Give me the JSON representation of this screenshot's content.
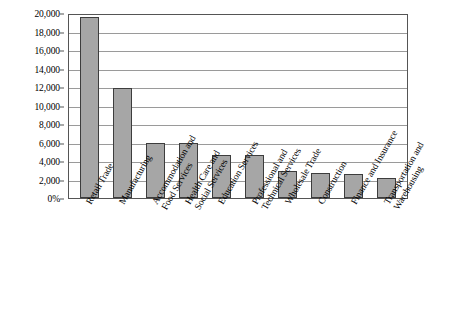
{
  "chart_data": {
    "type": "bar",
    "title": "",
    "xlabel": "",
    "ylabel": "",
    "ylim": [
      0,
      20000
    ],
    "grid": true,
    "legend": "none",
    "categories": [
      "Retail Trade",
      "Manufacturing",
      "Accommodation and Food Services",
      "Health Care and Social Services",
      "Education Services",
      "Professional and Technical Services",
      "Wholesale Trade",
      "Construction",
      "Finance and Insurance",
      "Transportation and Warehousing"
    ],
    "category_lines": [
      [
        "Retail Trade"
      ],
      [
        "Manufacturing"
      ],
      [
        "Accommodation and",
        "Food Services"
      ],
      [
        "Health Care and",
        "Social Services"
      ],
      [
        "Education Services"
      ],
      [
        "Professional and",
        "Technical Services"
      ],
      [
        "Wholesale Trade"
      ],
      [
        "Construction"
      ],
      [
        "Finance and Insurance"
      ],
      [
        "Transportation and",
        "Warehousing"
      ]
    ],
    "values": [
      19600,
      11900,
      6000,
      6000,
      4700,
      4600,
      2900,
      2700,
      2600,
      2200
    ],
    "ticks": [
      {
        "value": 20000,
        "label": "20,000"
      },
      {
        "value": 18000,
        "label": "18,000"
      },
      {
        "value": 16000,
        "label": "16,000"
      },
      {
        "value": 14000,
        "label": "14,000"
      },
      {
        "value": 12000,
        "label": "12,000"
      },
      {
        "value": 10000,
        "label": "10,000"
      },
      {
        "value": 8000,
        "label": "8,000"
      },
      {
        "value": 6000,
        "label": "6,000"
      },
      {
        "value": 4000,
        "label": "4,000"
      },
      {
        "value": 2000,
        "label": "2,000"
      },
      {
        "value": 0,
        "label": "0%"
      }
    ],
    "colors": {
      "bar_fill": "#a6a6a6",
      "bar_border": "#3d3d3d",
      "grid": "#9a9a9a",
      "frame": "#555555",
      "text": "#000000"
    }
  },
  "caption": {
    "text": ""
  }
}
